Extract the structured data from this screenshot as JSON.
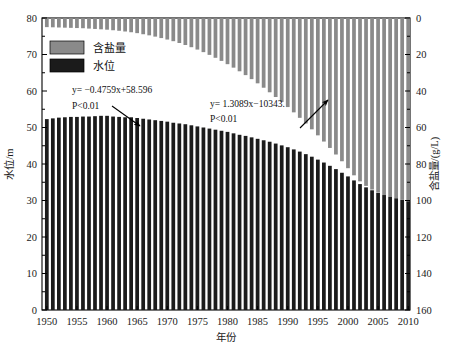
{
  "chart_data": {
    "type": "bar",
    "title": "",
    "xlabel": "年份",
    "ylabel_left": "水位/m",
    "ylabel_right": "含盐量/(g/L)",
    "xlim": [
      1949.2,
      2010.3
    ],
    "ylim_left": [
      0,
      80
    ],
    "ylim_right": [
      160,
      0
    ],
    "y_left_ticks": [
      0,
      10,
      20,
      30,
      40,
      50,
      60,
      70,
      80
    ],
    "y_right_ticks": [
      0,
      20,
      40,
      60,
      80,
      100,
      120,
      140,
      160
    ],
    "x_ticks": [
      1950,
      1955,
      1960,
      1965,
      1970,
      1975,
      1980,
      1985,
      1990,
      1995,
      2000,
      2005,
      2010
    ],
    "grid": false,
    "legend_position": "top-left",
    "x": [
      1950,
      1951,
      1952,
      1953,
      1954,
      1955,
      1956,
      1957,
      1958,
      1959,
      1960,
      1961,
      1962,
      1963,
      1964,
      1965,
      1966,
      1967,
      1968,
      1969,
      1970,
      1971,
      1972,
      1973,
      1974,
      1975,
      1976,
      1977,
      1978,
      1979,
      1980,
      1981,
      1982,
      1983,
      1984,
      1985,
      1986,
      1987,
      1988,
      1989,
      1990,
      1991,
      1992,
      1993,
      1994,
      1995,
      1996,
      1997,
      1998,
      1999,
      2000,
      2001,
      2002,
      2003,
      2004,
      2005,
      2006,
      2007,
      2008,
      2009,
      2010
    ],
    "series": [
      {
        "name": "水位",
        "axis": "left",
        "unit": "m",
        "color": "#1b1b1b",
        "values": [
          52.3,
          52.5,
          52.7,
          52.8,
          52.9,
          52.9,
          53.0,
          53.0,
          53.1,
          53.2,
          53.2,
          53.0,
          52.9,
          52.8,
          52.8,
          52.6,
          52.4,
          52.2,
          52.0,
          51.8,
          51.6,
          51.3,
          51.1,
          50.9,
          50.6,
          50.3,
          50.0,
          49.7,
          49.4,
          49.1,
          48.8,
          48.4,
          48.0,
          47.7,
          47.3,
          46.9,
          46.5,
          46.1,
          45.6,
          45.1,
          44.6,
          44.0,
          43.4,
          42.7,
          42.0,
          41.2,
          40.4,
          39.5,
          38.6,
          37.6,
          36.6,
          35.5,
          34.5,
          33.6,
          32.8,
          32.1,
          31.5,
          31.0,
          30.6,
          30.2,
          29.8
        ]
      },
      {
        "name": "含盐量",
        "axis": "right",
        "unit": "g/L",
        "color": "#8a8a8a",
        "values": [
          5.0,
          5.1,
          5.2,
          5.3,
          5.4,
          5.5,
          5.6,
          5.8,
          6.0,
          6.2,
          6.4,
          6.7,
          7.0,
          7.4,
          7.8,
          8.3,
          8.9,
          9.5,
          10.2,
          11.0,
          11.8,
          12.7,
          13.7,
          14.8,
          16.0,
          17.3,
          18.7,
          20.2,
          21.8,
          23.5,
          25.3,
          27.2,
          29.2,
          31.3,
          33.5,
          35.8,
          38.2,
          40.7,
          43.3,
          46.0,
          48.8,
          51.7,
          54.7,
          57.8,
          61.0,
          64.3,
          67.7,
          71.2,
          74.8,
          78.5,
          82.3,
          86.2,
          89.5,
          92.0,
          94.0,
          95.6,
          97.0,
          98.0,
          98.8,
          99.5,
          100.0
        ]
      }
    ],
    "trendlines": [
      {
        "id": "water-level-trend",
        "equation": "y= −0.4759x+58.596",
        "significance": "P<0.01",
        "slope": -0.4759,
        "intercept": 58.596,
        "style": "dashed",
        "axis": "left"
      },
      {
        "id": "salinity-trend",
        "equation": "y= 1.3089x−10343.",
        "significance": "P<0.01",
        "slope": 1.3089,
        "intercept": -10343,
        "style": "dashed",
        "axis": "right"
      }
    ],
    "legend": [
      {
        "label": "含盐量",
        "color": "#8a8a8a"
      },
      {
        "label": "水位",
        "color": "#1b1b1b"
      }
    ]
  },
  "axes": {
    "x_title": "年份",
    "y_left_title": "水位/m",
    "y_right_title": "含盐量/(g/L)"
  },
  "annotations": {
    "eq_left_line1": "y= −0.4759x+58.596",
    "eq_left_line2": "P<0.01",
    "eq_right_line1": "y= 1.3089x−10343.",
    "eq_right_line2": "P<0.01"
  },
  "colors": {
    "salinity_bar": "#8a8a8a",
    "water_bar": "#1b1b1b",
    "axis": "#000000",
    "trendline": "#6f6f6f"
  }
}
